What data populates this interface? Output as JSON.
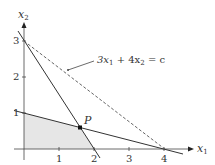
{
  "figure": {
    "axes": {
      "x_label": "x",
      "x_sub": "1",
      "y_label": "x",
      "y_sub": "2",
      "x_ticks": [
        "1",
        "2",
        "3",
        "4"
      ],
      "y_ticks": [
        "1",
        "2",
        "3"
      ]
    },
    "point_label": "P",
    "objective_label": {
      "coef1": "3x",
      "sub1": "1",
      "middle": " + 4x",
      "sub2": "2",
      "rhs": " = c"
    },
    "colors": {
      "line": "#333333",
      "feasible_fill": "#e6e6e6",
      "dashed": "#555555"
    },
    "constraints": [
      "3x1 + 2x2 = 6",
      "x1 + 4x2 = 4"
    ],
    "objective": "3x1 + 4x2 = c",
    "optimal_point": {
      "x1": 1.6,
      "x2": 0.6
    }
  }
}
